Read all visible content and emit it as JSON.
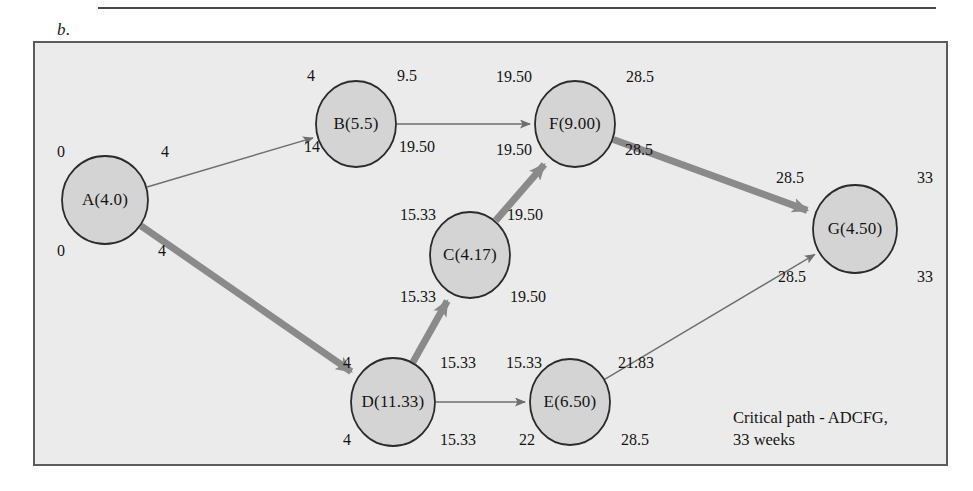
{
  "figure": {
    "label": "b.",
    "caption_line1": "Critical path - ADCFG,",
    "caption_line2": "33 weeks"
  },
  "colors": {
    "node_fill": "#d4d4d4",
    "node_stroke": "#2b2b2b",
    "panel_bg": "#ebebeb",
    "frame_stroke": "#5c5c5c",
    "thin_edge": "#6e6e6e",
    "critical_edge": "#8a8a8a",
    "text": "#141414"
  },
  "chart_data": {
    "type": "diagram",
    "critical_path": [
      "A",
      "D",
      "C",
      "F",
      "G"
    ],
    "project_duration": 33,
    "duration_units": "weeks",
    "nodes": [
      {
        "id": "A",
        "label": "A(4.0)",
        "duration": 4.0,
        "cx": 105,
        "cy": 200,
        "rx": 43,
        "ry": 44,
        "es": "0",
        "ef": "4",
        "ls": "0",
        "lf": "4",
        "es_pos": [
          61,
          152
        ],
        "ef_pos": [
          165,
          152
        ],
        "ls_pos": [
          61,
          251
        ],
        "lf_pos": [
          162,
          251
        ]
      },
      {
        "id": "B",
        "label": "B(5.5)",
        "duration": 5.5,
        "cx": 356,
        "cy": 124,
        "rx": 40,
        "ry": 43,
        "es": "4",
        "ef": "9.5",
        "ls": "14",
        "lf": "19.50",
        "es_pos": [
          311,
          76
        ],
        "ef_pos": [
          407,
          76
        ],
        "ls_pos": [
          312,
          147
        ],
        "lf_pos": [
          417,
          147
        ]
      },
      {
        "id": "C",
        "label": "C(4.17)",
        "duration": 4.17,
        "cx": 470,
        "cy": 255,
        "rx": 40,
        "ry": 43,
        "es": "15.33",
        "ef": "19.50",
        "ls": "15.33",
        "lf": "19.50",
        "es_pos": [
          418,
          215
        ],
        "ef_pos": [
          525,
          215
        ],
        "ls_pos": [
          418,
          297
        ],
        "lf_pos": [
          528,
          297
        ]
      },
      {
        "id": "D",
        "label": "D(11.33)",
        "duration": 11.33,
        "cx": 393,
        "cy": 402,
        "rx": 42,
        "ry": 44,
        "es": "4",
        "ef": "15.33",
        "ls": "4",
        "lf": "15.33",
        "es_pos": [
          347,
          363
        ],
        "ef_pos": [
          458,
          363
        ],
        "ls_pos": [
          347,
          440
        ],
        "lf_pos": [
          458,
          440
        ]
      },
      {
        "id": "E",
        "label": "E(6.50)",
        "duration": 6.5,
        "cx": 570,
        "cy": 402,
        "rx": 40,
        "ry": 43,
        "es": "15.33",
        "ef": "21.83",
        "ls": "22",
        "lf": "28.5",
        "es_pos": [
          524,
          363
        ],
        "ef_pos": [
          636,
          363
        ],
        "ls_pos": [
          527,
          440
        ],
        "lf_pos": [
          635,
          440
        ]
      },
      {
        "id": "F",
        "label": "F(9.00)",
        "duration": 9.0,
        "cx": 575,
        "cy": 124,
        "rx": 40,
        "ry": 43,
        "es": "19.50",
        "ef": "28.5",
        "ls": "19.50",
        "lf": "28.5",
        "es_pos": [
          514,
          77
        ],
        "ef_pos": [
          640,
          77
        ],
        "ls_pos": [
          514,
          150
        ],
        "lf_pos": [
          639,
          150
        ]
      },
      {
        "id": "G",
        "label": "G(4.50)",
        "duration": 4.5,
        "cx": 855,
        "cy": 229,
        "rx": 42,
        "ry": 44,
        "es": "28.5",
        "ef": "33",
        "ls": "28.5",
        "lf": "33",
        "es_pos": [
          790,
          178
        ],
        "ef_pos": [
          925,
          178
        ],
        "ls_pos": [
          792,
          277
        ],
        "lf_pos": [
          925,
          277
        ]
      }
    ],
    "edges": [
      {
        "from": "A",
        "to": "B",
        "critical": false
      },
      {
        "from": "A",
        "to": "D",
        "critical": true
      },
      {
        "from": "B",
        "to": "F",
        "critical": false
      },
      {
        "from": "D",
        "to": "C",
        "critical": true
      },
      {
        "from": "D",
        "to": "E",
        "critical": false
      },
      {
        "from": "C",
        "to": "F",
        "critical": true
      },
      {
        "from": "E",
        "to": "G",
        "critical": false
      },
      {
        "from": "F",
        "to": "G",
        "critical": true
      }
    ]
  }
}
